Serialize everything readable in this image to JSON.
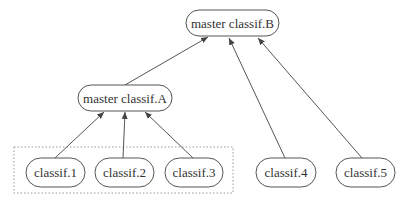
{
  "diagram": {
    "type": "hierarchy",
    "group_box": {
      "x": 14,
      "y": 147,
      "w": 219,
      "h": 46,
      "style": "dotted"
    },
    "nodes": [
      {
        "id": "B",
        "label": "master classif.B",
        "x": 186,
        "y": 10,
        "w": 93,
        "h": 26
      },
      {
        "id": "A",
        "label": "master classif.A",
        "x": 78,
        "y": 85,
        "w": 94,
        "h": 26
      },
      {
        "id": "c1",
        "label": "classif.1",
        "x": 26,
        "y": 158,
        "w": 59,
        "h": 29
      },
      {
        "id": "c2",
        "label": "classif.2",
        "x": 95,
        "y": 158,
        "w": 59,
        "h": 29
      },
      {
        "id": "c3",
        "label": "classif.3",
        "x": 165,
        "y": 158,
        "w": 58,
        "h": 29
      },
      {
        "id": "c4",
        "label": "classif.4",
        "x": 256,
        "y": 158,
        "w": 60,
        "h": 29
      },
      {
        "id": "c5",
        "label": "classif.5",
        "x": 336,
        "y": 158,
        "w": 59,
        "h": 29
      }
    ],
    "edges": [
      {
        "from": "c1",
        "to": "A",
        "x1": 55,
        "y1": 158,
        "x2": 104,
        "y2": 112
      },
      {
        "from": "c2",
        "to": "A",
        "x1": 123,
        "y1": 158,
        "x2": 125,
        "y2": 112
      },
      {
        "from": "c3",
        "to": "A",
        "x1": 193,
        "y1": 158,
        "x2": 145,
        "y2": 112
      },
      {
        "from": "A",
        "to": "B",
        "x1": 125,
        "y1": 85,
        "x2": 208,
        "y2": 37
      },
      {
        "from": "c4",
        "to": "B",
        "x1": 285,
        "y1": 158,
        "x2": 229,
        "y2": 38
      },
      {
        "from": "c5",
        "to": "B",
        "x1": 362,
        "y1": 158,
        "x2": 258,
        "y2": 38
      }
    ],
    "colors": {
      "stroke": "#555555",
      "text": "#333333",
      "group": "#999999"
    }
  }
}
